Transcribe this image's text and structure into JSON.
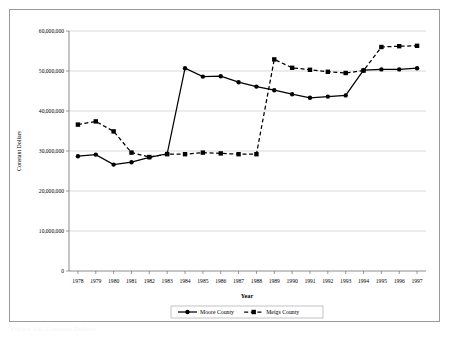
{
  "figure": {
    "caption": "Figure 1.6. Constant Dollars"
  },
  "chart_data": {
    "type": "line",
    "title": "",
    "xlabel": "Year",
    "ylabel": "Constant Dollars",
    "x": [
      1978,
      1979,
      1980,
      1981,
      1982,
      1983,
      1984,
      1985,
      1986,
      1987,
      1988,
      1989,
      1990,
      1991,
      1992,
      1993,
      1994,
      1995,
      1996,
      1997
    ],
    "xtick_labels": [
      "1978",
      "1979",
      "1980",
      "1981",
      "1982",
      "1983",
      "1984",
      "1985",
      "1986",
      "1987",
      "1988",
      "1989",
      "1990",
      "1991",
      "1992",
      "1993",
      "1994",
      "1995",
      "1996",
      "1997"
    ],
    "ylim": [
      0,
      60000000
    ],
    "yticks": [
      0,
      10000000,
      20000000,
      30000000,
      40000000,
      50000000,
      60000000
    ],
    "ytick_labels": [
      "0",
      "10,000,000",
      "20,000,000",
      "30,000,000",
      "40,000,000",
      "50,000,000",
      "60,000,000"
    ],
    "grid": "horizontal",
    "legend_position": "bottom-center",
    "series": [
      {
        "name": "Moore County",
        "marker": "circle",
        "linestyle": "solid",
        "color": "#000000",
        "values": [
          28700000,
          29100000,
          26600000,
          27200000,
          28400000,
          29300000,
          50700000,
          48600000,
          48700000,
          47200000,
          46100000,
          45200000,
          44200000,
          43300000,
          43600000,
          43900000,
          50200000,
          50400000,
          50400000,
          50700000
        ]
      },
      {
        "name": "Meigs County",
        "marker": "square",
        "linestyle": "dashed",
        "color": "#000000",
        "values": [
          36600000,
          37400000,
          34900000,
          29600000,
          28500000,
          29200000,
          29200000,
          29600000,
          29400000,
          29200000,
          29200000,
          52900000,
          50800000,
          50300000,
          49800000,
          49500000,
          50100000,
          56000000,
          56200000,
          56300000
        ]
      }
    ]
  },
  "legend": {
    "items": [
      {
        "label": "Moore County"
      },
      {
        "label": "Meigs County"
      }
    ]
  },
  "colors": {
    "line": "#000000",
    "grid": "#c9c9c9",
    "axis": "#6e6e6e",
    "frame": "#9a9a9a",
    "background": "#ffffff"
  }
}
